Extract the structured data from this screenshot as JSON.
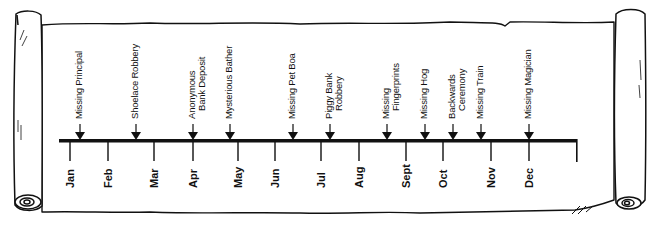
{
  "timeline": {
    "months": [
      {
        "label": "Jan",
        "x": 70
      },
      {
        "label": "Feb",
        "x": 108
      },
      {
        "label": "Mar",
        "x": 154
      },
      {
        "label": "Apr",
        "x": 193
      },
      {
        "label": "May",
        "x": 238
      },
      {
        "label": "Jun",
        "x": 275
      },
      {
        "label": "Jul",
        "x": 321
      },
      {
        "label": "Aug",
        "x": 359
      },
      {
        "label": "Sept",
        "x": 406
      },
      {
        "label": "Oct",
        "x": 443
      },
      {
        "label": "Nov",
        "x": 491
      },
      {
        "label": "Dec",
        "x": 529
      }
    ],
    "events": [
      {
        "lines": [
          "Missing Principal"
        ],
        "x": 80
      },
      {
        "lines": [
          "Shoelace Robbery"
        ],
        "x": 136
      },
      {
        "lines": [
          "Anonymous",
          "Bank Deposit"
        ],
        "x": 193
      },
      {
        "lines": [
          "Mysterious Bather"
        ],
        "x": 230
      },
      {
        "lines": [
          "Missing Pet Boa"
        ],
        "x": 293
      },
      {
        "lines": [
          "Piggy Bank",
          "Robbery"
        ],
        "x": 330
      },
      {
        "lines": [
          "Missing",
          "Fingerprints"
        ],
        "x": 387
      },
      {
        "lines": [
          "Missing Hog"
        ],
        "x": 425
      },
      {
        "lines": [
          "Backwards",
          "Ceremony"
        ],
        "x": 453
      },
      {
        "lines": [
          "Missing Train"
        ],
        "x": 481
      },
      {
        "lines": [
          "Missing Magician"
        ],
        "x": 529
      }
    ],
    "line_color": "#111111",
    "paper_color": "#ffffff"
  }
}
